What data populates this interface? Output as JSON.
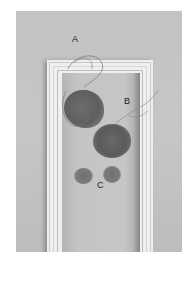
{
  "figure": {
    "labels": {
      "a": "A",
      "b": "B",
      "c": "C"
    },
    "colors": {
      "background": "#ffffff",
      "wall": "#c4c4c4",
      "frame": "#efefef",
      "specimen": "#626262",
      "label_text": "#1a1a1a"
    }
  }
}
